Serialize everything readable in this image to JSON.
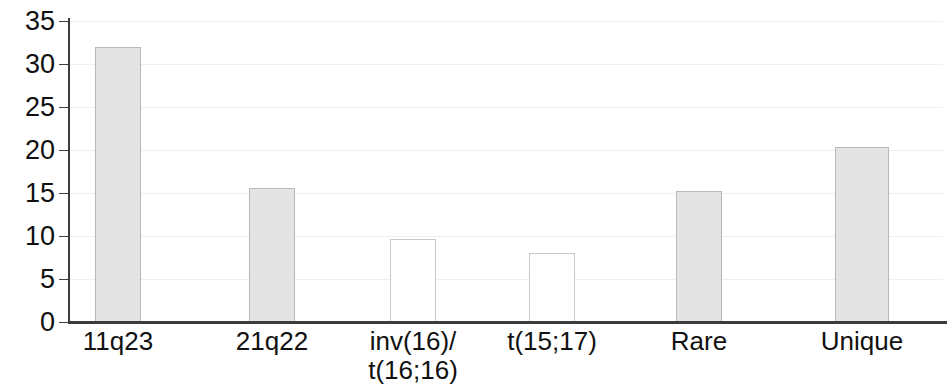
{
  "chart_data": {
    "type": "bar",
    "title": "",
    "subtitle": "",
    "xlabel": "",
    "ylabel": "",
    "ylim": [
      0,
      35
    ],
    "yticks": [
      0,
      5,
      10,
      15,
      20,
      25,
      30,
      35
    ],
    "ytick_labels": [
      "0",
      "5",
      "10",
      "15",
      "20",
      "25",
      "30",
      "35"
    ],
    "grid": true,
    "grid_axis": "y",
    "legend": false,
    "categories": [
      "11q23",
      "21q22",
      "inv(16)/\nt(16;16)",
      "t(15;17)",
      "Rare",
      "Unique"
    ],
    "category_lines": [
      [
        "11q23"
      ],
      [
        "21q22"
      ],
      [
        "inv(16)/",
        "t(16;16)"
      ],
      [
        "t(15;17)"
      ],
      [
        "Rare"
      ],
      [
        "Unique"
      ]
    ],
    "values": [
      32.0,
      15.6,
      9.6,
      8.0,
      15.2,
      20.4
    ],
    "bar_styles": [
      "filled",
      "filled",
      "empty",
      "empty",
      "filled",
      "filled"
    ],
    "colors": {
      "bar_fill": "#e4e4e4",
      "bar_empty_fill": "#ffffff",
      "bar_border": "#b8b8b8",
      "axis": "#3c3c3c",
      "gridline": "#efefef",
      "text": "#111111"
    }
  }
}
